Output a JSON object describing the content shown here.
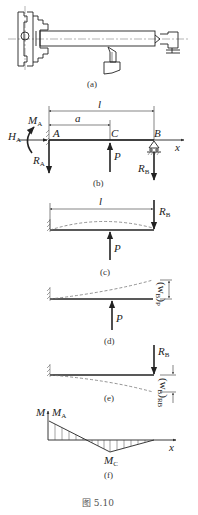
{
  "figure": {
    "caption": "图 5.10",
    "panels": {
      "a": {
        "label": "(a)",
        "description": "Lathe workpiece held in chuck, supported by tailstock, cutting tool below"
      },
      "b": {
        "label": "(b)",
        "dimension_l": "l",
        "dimension_a": "a",
        "points": {
          "A": "A",
          "C": "C",
          "B": "B"
        },
        "axis": "x",
        "forces": {
          "MA": {
            "main": "M",
            "sub": "A"
          },
          "HA": {
            "main": "H",
            "sub": "A"
          },
          "RA": {
            "main": "R",
            "sub": "A"
          },
          "P": "P",
          "RB": {
            "main": "R",
            "sub": "B"
          }
        }
      },
      "c": {
        "label": "(c)",
        "dimension_l": "l",
        "forces": {
          "RB": {
            "main": "R",
            "sub": "B"
          },
          "P": "P"
        }
      },
      "d": {
        "label": "(d)",
        "deflection": {
          "main": "(w",
          "sub": "B",
          "close": ")",
          "subscript2": "P"
        },
        "forces": {
          "P": "P"
        }
      },
      "e": {
        "label": "(e)",
        "deflection": {
          "main": "(w",
          "sub": "B",
          "close": ")",
          "subscript2": "RB"
        },
        "forces": {
          "RB": {
            "main": "R",
            "sub": "B"
          }
        }
      },
      "f": {
        "label": "(f)",
        "axis_y": "M",
        "axis_x": "x",
        "MA": {
          "main": "M",
          "sub": "A"
        },
        "MC": {
          "main": "M",
          "sub": "C"
        }
      }
    }
  },
  "colors": {
    "line": "#222222",
    "dashed": "#777777",
    "background": "#ffffff"
  }
}
